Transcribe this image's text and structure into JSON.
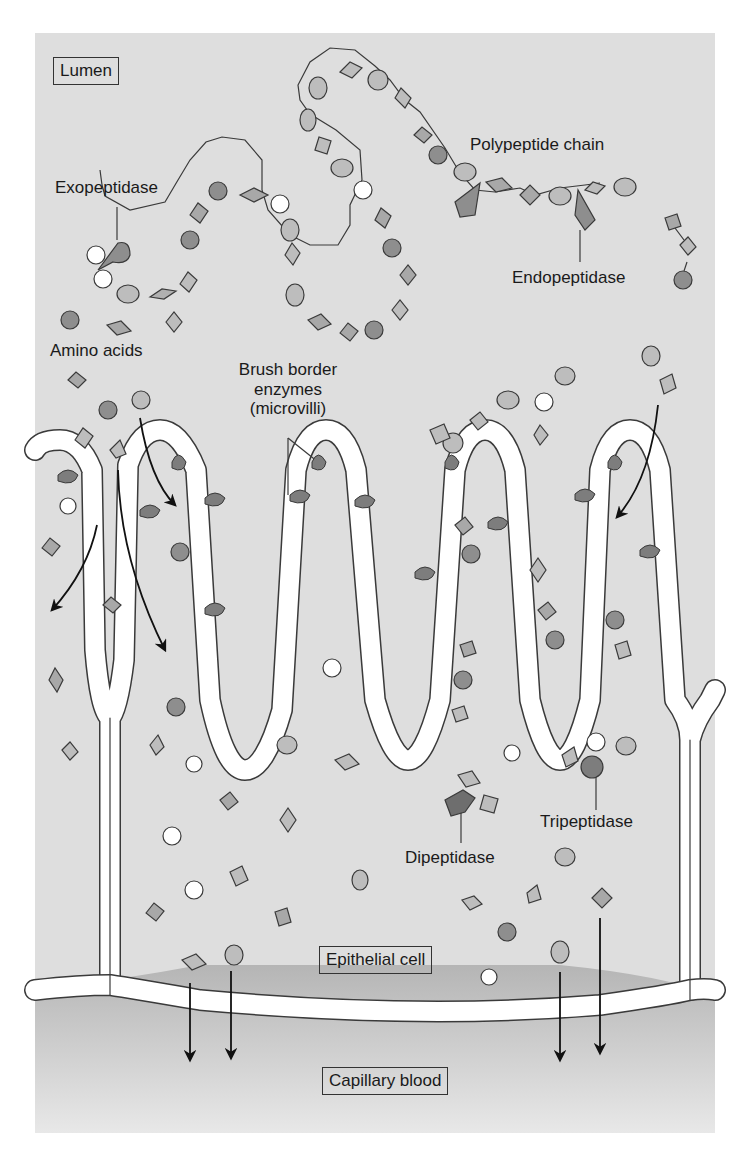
{
  "figure": {
    "colors": {
      "lumen_bg": "#dcdcdc",
      "cell_bg": "#d6d6d6",
      "villus_core": "#c9c9c9",
      "membrane": "#ffffff",
      "blood_top": "#b9b9b9",
      "blood_bottom": "#e6e6e6",
      "dark_residue": "#8e8e8e",
      "mid_residue": "#a8a8a8",
      "light_residue": "#bdbdbd",
      "open_residue": "#ffffff",
      "enzyme": "#7d7d7d",
      "outline": "#3a3a3a"
    },
    "labels": {
      "lumen": "Lumen",
      "polypeptide_chain": "Polypeptide chain",
      "exopeptidase": "Exopeptidase",
      "endopeptidase": "Endopeptidase",
      "amino_acids": "Amino acids",
      "brush_border_1": "Brush border",
      "brush_border_2": "enzymes",
      "brush_border_3": "(microvilli)",
      "tripeptidase": "Tripeptidase",
      "dipeptidase": "Dipeptidase",
      "epithelial_cell": "Epithelial cell",
      "capillary_blood": "Capillary blood"
    },
    "legend_shapes": [
      "dark-circle",
      "oval",
      "open-octagon",
      "diamond"
    ],
    "regions": [
      "Lumen",
      "Epithelial cell",
      "Capillary blood"
    ]
  }
}
